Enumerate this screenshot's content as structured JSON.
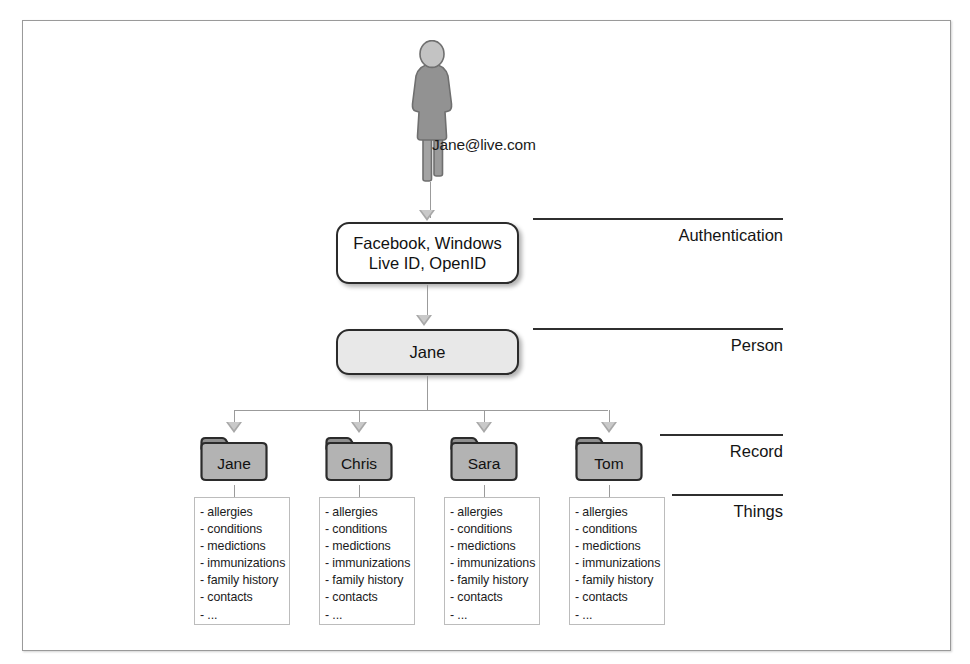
{
  "diagram": {
    "person": {
      "icon": "person-silhouette-icon",
      "email": "Jane@live.com"
    },
    "auth_box": {
      "line1": "Facebook, Windows",
      "line2": "Live ID, OpenID"
    },
    "person_box": {
      "label": "Jane"
    },
    "tiers": [
      {
        "key": "authentication",
        "label": "Authentication",
        "rule_left": 533,
        "rule_width": 250,
        "top": 218
      },
      {
        "key": "person",
        "label": "Person",
        "rule_left": 533,
        "rule_width": 250,
        "top": 328
      },
      {
        "key": "record",
        "label": "Record",
        "rule_left": 660,
        "rule_width": 123,
        "top": 434
      },
      {
        "key": "things",
        "label": "Things",
        "rule_left": 672,
        "rule_width": 111,
        "top": 494
      }
    ],
    "records": [
      {
        "folder": "Jane",
        "x": 198
      },
      {
        "folder": "Chris",
        "x": 323
      },
      {
        "folder": "Sara",
        "x": 448
      },
      {
        "folder": "Tom",
        "x": 573
      }
    ],
    "things_items": [
      "- allergies",
      "- conditions",
      "- medictions",
      "- immunizations",
      "- family history",
      "- contacts",
      "- ..."
    ],
    "colors": {
      "frame_border": "#9a9a9a",
      "connector": "#9b9b9b",
      "arrow_fill": "#c9c9c9",
      "arrow_outline": "#a8a8a8",
      "box_border": "#2b2b2b",
      "person_box_fill": "#e8e8e8",
      "folder_body": "#b3b3b3",
      "folder_tab": "#8f8f8f",
      "folder_outline": "#2b2b2b",
      "silhouette": "#8d8d8d",
      "text": "#111111"
    }
  }
}
